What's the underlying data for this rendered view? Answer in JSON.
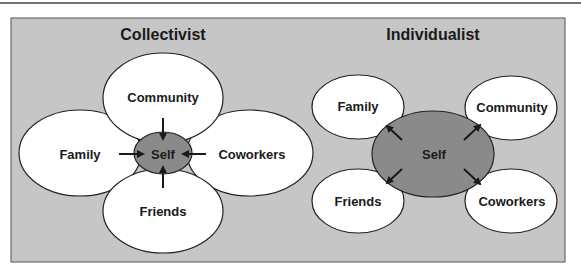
{
  "colors": {
    "panel": "#c6c6c6",
    "ellipse_fill": "#ffffff",
    "self_fill": "#8a8a8a",
    "stroke": "#222222"
  },
  "collectivist": {
    "title": "Collectivist",
    "center": "Self",
    "nodes": [
      "Community",
      "Family",
      "Coworkers",
      "Friends"
    ],
    "arrow_direction": "inward"
  },
  "individualist": {
    "title": "Individualist",
    "center": "Self",
    "nodes": [
      "Family",
      "Community",
      "Friends",
      "Coworkers"
    ],
    "arrow_direction": "outward"
  }
}
